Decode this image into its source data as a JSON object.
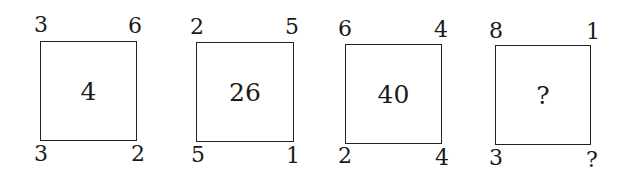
{
  "squares": [
    {
      "top_left": "3",
      "top_right": "6",
      "bottom_left": "3",
      "bottom_right": "2",
      "center": "4"
    },
    {
      "top_left": "2",
      "top_right": "5",
      "bottom_left": "5",
      "bottom_right": "1",
      "center": "26"
    },
    {
      "top_left": "6",
      "top_right": "4",
      "bottom_left": "2",
      "bottom_right": "4",
      "center": "40"
    },
    {
      "top_left": "8",
      "top_right": "1",
      "bottom_left": "3",
      "bottom_right": "?",
      "center": "?"
    }
  ]
}
